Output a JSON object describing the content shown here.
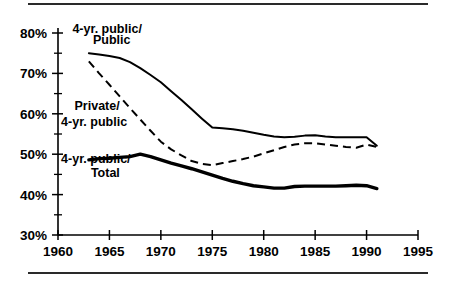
{
  "figure": {
    "has_top_rule": true,
    "has_bottom_rule": true,
    "background": "#ffffff",
    "ink": "#000000"
  },
  "chart_data": {
    "type": "line",
    "title": "",
    "subtitle": "",
    "xlabel": "",
    "ylabel": "",
    "xlim": [
      1960,
      1995
    ],
    "ylim": [
      30,
      80
    ],
    "grid": false,
    "legend_position": "inline-annotations",
    "x_ticks": [
      1960,
      1965,
      1970,
      1975,
      1980,
      1985,
      1990,
      1995
    ],
    "x_tick_labels": [
      "1960",
      "1965",
      "1970",
      "1975",
      "1980",
      "1985",
      "1990",
      "1995"
    ],
    "x_minor_ticks": [],
    "y_ticks": [
      30,
      40,
      50,
      60,
      70,
      80
    ],
    "y_tick_labels": [
      "30%",
      "40%",
      "50%",
      "60%",
      "70%",
      "80%"
    ],
    "y_minor_ticks": [
      35,
      45,
      55,
      65,
      75
    ],
    "annotations": [
      {
        "text": "4-yr. public/",
        "x": 1961.4,
        "y": 80.0,
        "series": "4-yr. public/Public"
      },
      {
        "text": "Public",
        "x": 1963.4,
        "y": 77.2,
        "series": "4-yr. public/Public"
      },
      {
        "text": "Private/",
        "x": 1961.6,
        "y": 61.0,
        "series": "Private/4-yr. public"
      },
      {
        "text": "4-yr. public",
        "x": 1960.3,
        "y": 57.0,
        "series": "Private/4-yr. public"
      },
      {
        "text": "4-yr. public/",
        "x": 1960.3,
        "y": 47.8,
        "series": "4-yr. public/Total"
      },
      {
        "text": "Total",
        "x": 1963.2,
        "y": 44.4,
        "series": "4-yr. public/Total"
      }
    ],
    "series": [
      {
        "name": "4-yr. public/Public",
        "style": "solid-thin",
        "x": [
          1963,
          1964,
          1965,
          1966,
          1967,
          1968,
          1969,
          1970,
          1971,
          1972,
          1973,
          1974,
          1975,
          1976,
          1977,
          1978,
          1979,
          1980,
          1981,
          1982,
          1983,
          1984,
          1985,
          1986,
          1987,
          1988,
          1989,
          1990,
          1991
        ],
        "values": [
          75.0,
          74.7,
          74.3,
          73.8,
          72.8,
          71.3,
          69.6,
          67.8,
          65.6,
          63.4,
          61.1,
          58.8,
          56.6,
          56.4,
          56.2,
          55.8,
          55.3,
          54.8,
          54.4,
          54.2,
          54.3,
          54.6,
          54.7,
          54.4,
          54.2,
          54.2,
          54.2,
          54.2,
          52.1
        ]
      },
      {
        "name": "Private/4-yr. public",
        "style": "dashed",
        "x": [
          1963,
          1964,
          1965,
          1966,
          1967,
          1968,
          1969,
          1970,
          1971,
          1972,
          1973,
          1974,
          1975,
          1976,
          1977,
          1978,
          1979,
          1980,
          1981,
          1982,
          1983,
          1984,
          1985,
          1986,
          1987,
          1988,
          1989,
          1990,
          1991
        ],
        "values": [
          73.0,
          70.0,
          67.2,
          64.3,
          61.4,
          58.6,
          55.8,
          53.1,
          51.2,
          49.7,
          48.3,
          47.6,
          47.3,
          47.8,
          48.3,
          48.8,
          49.4,
          50.2,
          51.0,
          51.8,
          52.4,
          52.7,
          52.7,
          52.4,
          52.1,
          51.8,
          51.6,
          52.4,
          51.8
        ]
      },
      {
        "name": "4-yr. public/Total",
        "style": "solid-thick",
        "x": [
          1963,
          1964,
          1965,
          1966,
          1967,
          1968,
          1969,
          1970,
          1971,
          1972,
          1973,
          1974,
          1975,
          1976,
          1977,
          1978,
          1979,
          1980,
          1981,
          1982,
          1983,
          1984,
          1985,
          1986,
          1987,
          1988,
          1989,
          1990,
          1991
        ],
        "values": [
          48.6,
          48.9,
          49.0,
          49.2,
          49.4,
          50.0,
          49.4,
          48.6,
          47.8,
          47.1,
          46.4,
          45.6,
          44.8,
          44.0,
          43.3,
          42.7,
          42.2,
          41.9,
          41.6,
          41.6,
          42.0,
          42.1,
          42.1,
          42.1,
          42.1,
          42.2,
          42.3,
          42.2,
          41.5
        ]
      }
    ]
  }
}
